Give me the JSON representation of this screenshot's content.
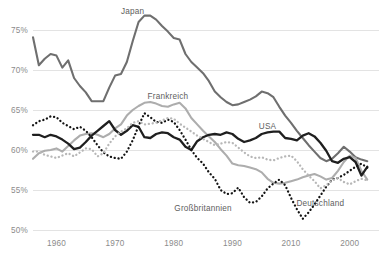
{
  "chart_data": {
    "type": "line",
    "title": "",
    "subtitle": "",
    "xlabel": "",
    "ylabel": "",
    "grid": true,
    "legend_position": "inline-labels",
    "xlim": [
      1956,
      2015
    ],
    "ylim": [
      50,
      77.5
    ],
    "y_ticks": [
      50,
      55,
      60,
      65,
      70,
      75
    ],
    "y_tick_labels": [
      "50%",
      "55%",
      "60%",
      "65%",
      "70%",
      "75%"
    ],
    "x_ticks": [
      1960,
      1970,
      1980,
      1990,
      2000,
      2010
    ],
    "x_tick_labels": [
      "1960",
      "1970",
      "1980",
      "1990",
      "2010",
      "2000"
    ],
    "series": [
      {
        "name": "Japan",
        "color": "#6f6f6f",
        "style": "solid",
        "width": 2.1,
        "label_x": 1973,
        "label_y": 77.0,
        "x": [
          1956,
          1957,
          1958,
          1959,
          1960,
          1961,
          1962,
          1963,
          1964,
          1965,
          1966,
          1967,
          1968,
          1969,
          1970,
          1971,
          1972,
          1973,
          1974,
          1975,
          1976,
          1977,
          1978,
          1979,
          1980,
          1981,
          1982,
          1983,
          1984,
          1985,
          1986,
          1987,
          1988,
          1989,
          1990,
          1991,
          1992,
          1993,
          1994,
          1995,
          1996,
          1997,
          1998,
          1999,
          2000,
          2001,
          2002,
          2003,
          2004,
          2005,
          2006,
          2007,
          2008,
          2009,
          2010,
          2011,
          2012,
          2013
        ],
        "y": [
          74.1,
          70.6,
          71.4,
          72.0,
          71.8,
          70.3,
          71.2,
          69.0,
          68.0,
          67.2,
          66.1,
          66.1,
          66.1,
          67.8,
          69.3,
          69.5,
          71.0,
          73.6,
          76.0,
          76.8,
          76.8,
          76.3,
          75.5,
          74.8,
          74.0,
          73.8,
          72.0,
          71.0,
          70.3,
          69.6,
          68.6,
          67.3,
          66.6,
          66.0,
          65.6,
          65.7,
          66.0,
          66.3,
          66.7,
          67.3,
          67.1,
          66.6,
          65.4,
          64.3,
          63.4,
          62.4,
          61.5,
          60.6,
          59.8,
          59.0,
          58.6,
          58.9,
          59.6,
          60.4,
          59.8,
          59.1,
          58.8,
          58.6
        ]
      },
      {
        "name": "Frankreich",
        "color": "#adadad",
        "style": "solid",
        "width": 2.1,
        "label_x": 1979,
        "label_y": 66.4,
        "x": [
          1956,
          1957,
          1958,
          1959,
          1960,
          1961,
          1962,
          1963,
          1964,
          1965,
          1966,
          1967,
          1968,
          1969,
          1970,
          1971,
          1972,
          1973,
          1974,
          1975,
          1976,
          1977,
          1978,
          1979,
          1980,
          1981,
          1982,
          1983,
          1984,
          1985,
          1986,
          1987,
          1988,
          1989,
          1990,
          1991,
          1992,
          1993,
          1994,
          1995,
          1996,
          1997,
          1998,
          1999,
          2000,
          2001,
          2002,
          2003,
          2004,
          2005,
          2006,
          2007,
          2008,
          2009,
          2010,
          2011,
          2012,
          2013
        ],
        "y": [
          58.9,
          59.6,
          59.9,
          60.0,
          60.2,
          59.8,
          60.5,
          61.2,
          61.8,
          62.0,
          62.1,
          61.9,
          61.6,
          62.0,
          62.7,
          63.2,
          64.3,
          65.0,
          65.5,
          65.9,
          66.0,
          65.8,
          65.5,
          65.4,
          65.7,
          65.9,
          65.2,
          64.0,
          63.2,
          62.4,
          61.7,
          61.0,
          60.1,
          59.3,
          58.3,
          58.1,
          58.0,
          57.8,
          57.6,
          57.2,
          56.4,
          55.9,
          55.8,
          55.9,
          56.1,
          56.3,
          56.6,
          56.8,
          57.0,
          56.7,
          56.3,
          56.5,
          57.4,
          58.5,
          59.3,
          59.0,
          57.4,
          56.3
        ]
      },
      {
        "name": "USA",
        "color": "#1f1f1f",
        "style": "solid",
        "width": 2.3,
        "label_x": 1996,
        "label_y": 62.6,
        "x": [
          1956,
          1957,
          1958,
          1959,
          1960,
          1961,
          1962,
          1963,
          1964,
          1965,
          1966,
          1967,
          1968,
          1969,
          1970,
          1971,
          1972,
          1973,
          1974,
          1975,
          1976,
          1977,
          1978,
          1979,
          1980,
          1981,
          1982,
          1983,
          1984,
          1985,
          1986,
          1987,
          1988,
          1989,
          1990,
          1991,
          1992,
          1993,
          1994,
          1995,
          1996,
          1997,
          1998,
          1999,
          2000,
          2001,
          2002,
          2003,
          2004,
          2005,
          2006,
          2007,
          2008,
          2009,
          2010,
          2011,
          2012,
          2013
        ],
        "y": [
          61.9,
          61.9,
          61.6,
          61.9,
          61.7,
          61.3,
          60.8,
          60.1,
          60.3,
          61.0,
          61.8,
          62.4,
          63.0,
          63.6,
          62.5,
          61.9,
          62.4,
          63.1,
          62.9,
          61.6,
          61.5,
          62.0,
          62.2,
          62.1,
          61.6,
          61.3,
          60.4,
          60.0,
          61.1,
          61.6,
          61.9,
          62.0,
          61.9,
          62.2,
          62.0,
          61.4,
          61.0,
          61.2,
          61.5,
          62.0,
          62.2,
          62.3,
          62.3,
          61.5,
          61.4,
          61.2,
          61.8,
          62.1,
          61.7,
          60.9,
          59.9,
          58.6,
          58.4,
          58.9,
          59.1,
          58.5,
          56.8,
          57.9
        ]
      },
      {
        "name": "Großbritannien",
        "color": "#141414",
        "style": "dotted",
        "width": 2.3,
        "label_x": 1985,
        "label_y": 52.4,
        "x": [
          1956,
          1957,
          1958,
          1959,
          1960,
          1961,
          1962,
          1963,
          1964,
          1965,
          1966,
          1967,
          1968,
          1969,
          1970,
          1971,
          1972,
          1973,
          1974,
          1975,
          1976,
          1977,
          1978,
          1979,
          1980,
          1981,
          1982,
          1983,
          1984,
          1985,
          1986,
          1987,
          1988,
          1989,
          1990,
          1991,
          1992,
          1993,
          1994,
          1995,
          1996,
          1997,
          1998,
          1999,
          2000,
          2001,
          2002,
          2003,
          2004,
          2005,
          2006,
          2007,
          2008,
          2009,
          2010,
          2011,
          2012,
          2013
        ],
        "y": [
          63.1,
          63.6,
          63.8,
          64.2,
          64.1,
          63.4,
          63.0,
          62.6,
          62.9,
          62.4,
          61.6,
          60.6,
          59.7,
          59.2,
          59.0,
          58.9,
          59.8,
          61.2,
          63.0,
          64.6,
          64.1,
          63.5,
          63.4,
          63.8,
          63.5,
          62.5,
          61.3,
          60.0,
          59.0,
          58.3,
          57.2,
          56.4,
          55.0,
          54.5,
          54.6,
          55.3,
          54.1,
          53.4,
          53.5,
          54.2,
          55.2,
          55.8,
          56.3,
          55.6,
          54.0,
          52.6,
          51.4,
          52.2,
          53.2,
          54.3,
          55.4,
          56.3,
          56.5,
          56.9,
          57.4,
          57.9,
          58.3,
          57.8
        ]
      },
      {
        "name": "Deutschland",
        "color": "#b7b7b7",
        "style": "dotted",
        "width": 2.3,
        "label_x": 2005,
        "label_y": 53.0,
        "x": [
          1956,
          1957,
          1958,
          1959,
          1960,
          1961,
          1962,
          1963,
          1964,
          1965,
          1966,
          1967,
          1968,
          1969,
          1970,
          1971,
          1972,
          1973,
          1974,
          1975,
          1976,
          1977,
          1978,
          1979,
          1980,
          1981,
          1982,
          1983,
          1984,
          1985,
          1986,
          1987,
          1988,
          1989,
          1990,
          1991,
          1992,
          1993,
          1994,
          1995,
          1996,
          1997,
          1998,
          1999,
          2000,
          2001,
          2002,
          2003,
          2004,
          2005,
          2006,
          2007,
          2008,
          2009,
          2010,
          2011,
          2012,
          2013
        ],
        "y": [
          59.8,
          59.8,
          59.4,
          59.2,
          59.0,
          59.3,
          59.6,
          59.2,
          59.7,
          60.2,
          60.1,
          59.2,
          59.6,
          60.8,
          61.7,
          62.3,
          62.7,
          63.4,
          63.6,
          63.2,
          63.3,
          63.4,
          63.7,
          64.0,
          63.9,
          63.3,
          62.8,
          62.3,
          61.8,
          61.4,
          61.0,
          60.6,
          60.8,
          61.0,
          60.9,
          60.3,
          59.7,
          59.2,
          59.0,
          59.1,
          58.8,
          58.7,
          59.0,
          59.2,
          59.3,
          58.6,
          57.6,
          56.8,
          56.1,
          55.2,
          55.6,
          56.2,
          56.5,
          56.0,
          55.7,
          56.1,
          56.4,
          56.2
        ]
      }
    ]
  }
}
